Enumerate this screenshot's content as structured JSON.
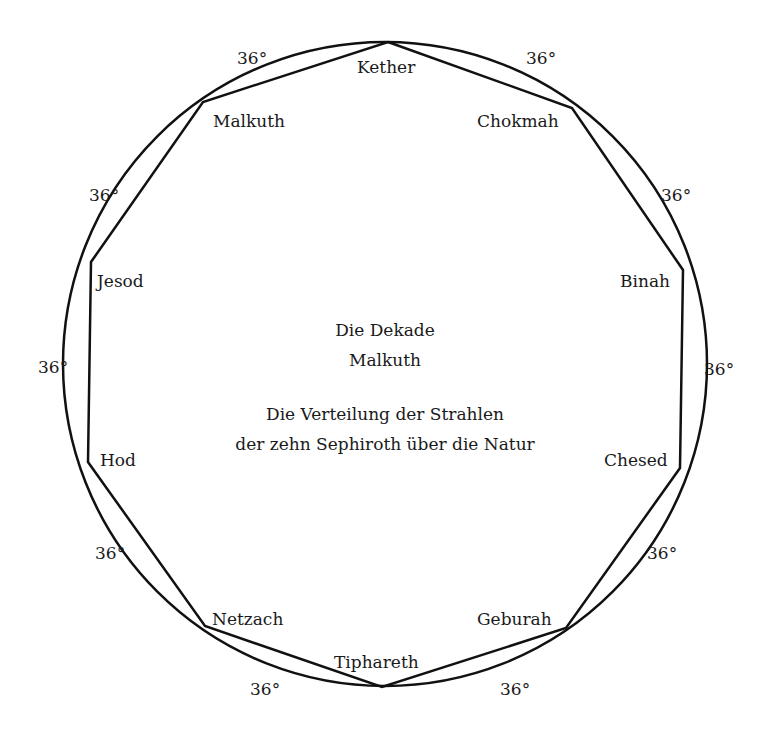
{
  "diagram": {
    "title_line1": "Die Dekade",
    "title_line2": "Malkuth",
    "subtitle_line1": "Die Verteilung der Strahlen",
    "subtitle_line2": "der zehn Sephiroth über die Natur",
    "circle": {
      "cx": 385,
      "cy": 364,
      "r": 322,
      "stroke": "#111111"
    },
    "sephiroth": [
      {
        "name": "Kether",
        "x": 388,
        "y": 42
      },
      {
        "name": "Chokmah",
        "x": 572,
        "y": 108
      },
      {
        "name": "Binah",
        "x": 683,
        "y": 270
      },
      {
        "name": "Chesed",
        "x": 680,
        "y": 468
      },
      {
        "name": "Geburah",
        "x": 566,
        "y": 628
      },
      {
        "name": "Tiphareth",
        "x": 382,
        "y": 687
      },
      {
        "name": "Netzach",
        "x": 205,
        "y": 626
      },
      {
        "name": "Hod",
        "x": 88,
        "y": 462
      },
      {
        "name": "Jesod",
        "x": 91,
        "y": 262
      },
      {
        "name": "Malkuth",
        "x": 203,
        "y": 102
      }
    ],
    "arc_angle_label": "36°"
  }
}
